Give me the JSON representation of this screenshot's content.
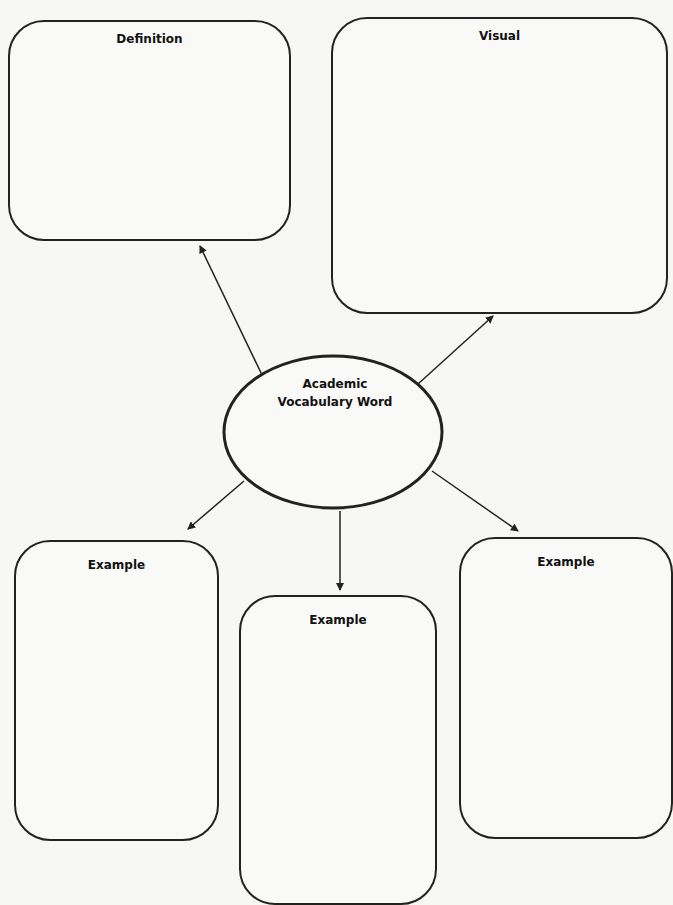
{
  "center": {
    "line1": "Academic",
    "line2": "Vocabulary Word"
  },
  "boxes": {
    "definition": {
      "title": "Definition"
    },
    "visual": {
      "title": "Visual"
    },
    "example_left": {
      "title": "Example"
    },
    "example_middle": {
      "title": "Example"
    },
    "example_right": {
      "title": "Example"
    }
  },
  "colors": {
    "stroke": "#222222",
    "background": "#f7f7f5"
  }
}
